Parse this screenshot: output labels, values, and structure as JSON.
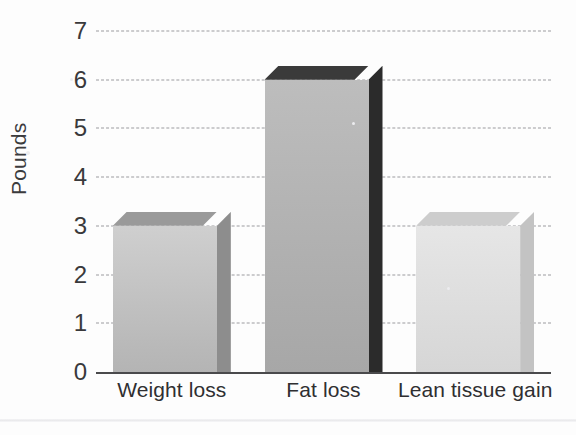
{
  "chart_data": {
    "type": "bar",
    "title": "",
    "subtitle": "",
    "xlabel": "",
    "ylabel": "Pounds",
    "categories": [
      "Weight loss",
      "Fat loss",
      "Lean tissue gain"
    ],
    "values": [
      3,
      6,
      3
    ],
    "ylim": [
      0,
      7
    ],
    "yticks": [
      0,
      1,
      2,
      3,
      4,
      5,
      6,
      7
    ],
    "ytick_labels": [
      "0",
      "1",
      "2",
      "3",
      "4",
      "5",
      "6",
      "7"
    ],
    "grid": true,
    "grid_style": "dashed",
    "grid_color": "#9b9b9f",
    "legend": false,
    "legend_position": "none",
    "style": "3d-bar",
    "series": [
      {
        "name": "Pounds",
        "values": [
          3,
          6,
          3
        ],
        "bar_colors": [
          {
            "front_top": "#cfcfcf",
            "front_bottom": "#b4b4b4",
            "top": "#9a9a9a",
            "side": "#8d8d8d"
          },
          {
            "front_top": "#bdbdbd",
            "front_bottom": "#a7a7a7",
            "top": "#3a3a3a",
            "side": "#2b2b2b"
          },
          {
            "front_top": "#e6e6e6",
            "front_bottom": "#d6d6d6",
            "top": "#cdcdcd",
            "side": "#c3c3c3"
          }
        ]
      }
    ],
    "axis_color": "#4a4a4c",
    "background": "#fdfdfd",
    "annotations": []
  },
  "axis": {
    "y_title": "Pounds"
  }
}
